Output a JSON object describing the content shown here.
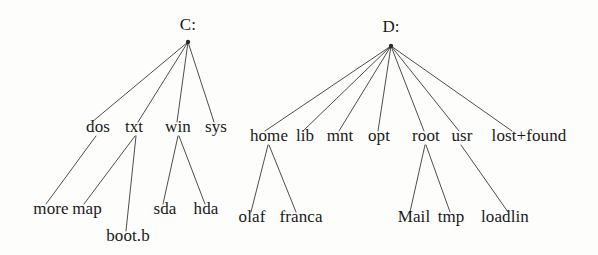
{
  "diagram": {
    "title": "",
    "type": "filesystem-tree",
    "ink_color": "#19191a",
    "line_color": "#3a3a38",
    "background_color": "#fdfdfb",
    "trees": [
      {
        "id": "c-drive",
        "root": {
          "label": "C:",
          "x": 188,
          "y": 30,
          "node_x": 188,
          "node_y": 42
        },
        "level2": [
          {
            "label": "dos",
            "x": 98,
            "y": 132,
            "anchor_x": 98,
            "anchor_y": 122
          },
          {
            "label": "txt",
            "x": 134,
            "y": 132,
            "anchor_x": 134,
            "anchor_y": 122
          },
          {
            "label": "win",
            "x": 178,
            "y": 132,
            "anchor_x": 178,
            "anchor_y": 122
          },
          {
            "label": "sys",
            "x": 216,
            "y": 132,
            "anchor_x": 216,
            "anchor_y": 122
          }
        ],
        "level3": [
          {
            "label": "more",
            "x": 51,
            "y": 214,
            "parent": "dos"
          },
          {
            "label": "map",
            "x": 87,
            "y": 214,
            "parent": "txt"
          },
          {
            "label": "boot.b",
            "x": 128,
            "y": 241,
            "parent": "txt"
          },
          {
            "label": "sda",
            "x": 165,
            "y": 214,
            "parent": "win"
          },
          {
            "label": "hda",
            "x": 206,
            "y": 214,
            "parent": "win"
          }
        ]
      },
      {
        "id": "d-drive",
        "root": {
          "label": "D:",
          "x": 391,
          "y": 32,
          "node_x": 391,
          "node_y": 46
        },
        "level2": [
          {
            "label": "home",
            "x": 269,
            "y": 141,
            "anchor_x": 269,
            "anchor_y": 131
          },
          {
            "label": "lib",
            "x": 305,
            "y": 141,
            "anchor_x": 305,
            "anchor_y": 131
          },
          {
            "label": "mnt",
            "x": 340,
            "y": 141,
            "anchor_x": 340,
            "anchor_y": 131
          },
          {
            "label": "opt",
            "x": 379,
            "y": 141,
            "anchor_x": 379,
            "anchor_y": 131
          },
          {
            "label": "root",
            "x": 426,
            "y": 141,
            "anchor_x": 426,
            "anchor_y": 131
          },
          {
            "label": "usr",
            "x": 462,
            "y": 141,
            "anchor_x": 462,
            "anchor_y": 131
          },
          {
            "label": "lost+found",
            "x": 529,
            "y": 141,
            "anchor_x": 512,
            "anchor_y": 131
          }
        ],
        "level3": [
          {
            "label": "olaf",
            "x": 252,
            "y": 222,
            "parent": "home"
          },
          {
            "label": "franca",
            "x": 301,
            "y": 222,
            "parent": "home"
          },
          {
            "label": "Mail",
            "x": 414,
            "y": 222,
            "parent": "root"
          },
          {
            "label": "tmp",
            "x": 451,
            "y": 222,
            "parent": "root"
          },
          {
            "label": "loadlin",
            "x": 505,
            "y": 222,
            "parent": "usr"
          }
        ]
      }
    ],
    "edges": [
      {
        "name": "c-root-to-dos",
        "x1": 188,
        "y1": 42,
        "x2": 92,
        "y2": 122
      },
      {
        "name": "c-root-to-txt",
        "x1": 188,
        "y1": 42,
        "x2": 138,
        "y2": 122
      },
      {
        "name": "c-root-to-win",
        "x1": 188,
        "y1": 42,
        "x2": 177,
        "y2": 122
      },
      {
        "name": "c-root-to-sys",
        "x1": 188,
        "y1": 42,
        "x2": 214,
        "y2": 122
      },
      {
        "name": "c-dos-to-more",
        "x1": 96,
        "y1": 136,
        "x2": 46,
        "y2": 204
      },
      {
        "name": "c-txt-to-map",
        "x1": 135,
        "y1": 136,
        "x2": 84,
        "y2": 204
      },
      {
        "name": "c-txt-to-bootb",
        "x1": 136,
        "y1": 136,
        "x2": 126,
        "y2": 231
      },
      {
        "name": "c-win-to-sda",
        "x1": 178,
        "y1": 136,
        "x2": 163,
        "y2": 204
      },
      {
        "name": "c-win-to-hda",
        "x1": 179,
        "y1": 136,
        "x2": 205,
        "y2": 204
      },
      {
        "name": "d-root-to-home",
        "x1": 391,
        "y1": 46,
        "x2": 265,
        "y2": 131
      },
      {
        "name": "d-root-to-lib",
        "x1": 391,
        "y1": 46,
        "x2": 303,
        "y2": 131
      },
      {
        "name": "d-root-to-mnt",
        "x1": 391,
        "y1": 46,
        "x2": 339,
        "y2": 131
      },
      {
        "name": "d-root-to-opt",
        "x1": 391,
        "y1": 46,
        "x2": 378,
        "y2": 131
      },
      {
        "name": "d-root-to-root",
        "x1": 391,
        "y1": 46,
        "x2": 424,
        "y2": 131
      },
      {
        "name": "d-root-to-usr",
        "x1": 391,
        "y1": 46,
        "x2": 459,
        "y2": 131
      },
      {
        "name": "d-root-to-lostfound",
        "x1": 391,
        "y1": 46,
        "x2": 512,
        "y2": 131
      },
      {
        "name": "d-home-to-olaf",
        "x1": 268,
        "y1": 145,
        "x2": 251,
        "y2": 212
      },
      {
        "name": "d-home-to-franca",
        "x1": 269,
        "y1": 145,
        "x2": 296,
        "y2": 212
      },
      {
        "name": "d-root-dir-to-mail",
        "x1": 425,
        "y1": 145,
        "x2": 410,
        "y2": 212
      },
      {
        "name": "d-root-dir-to-tmp",
        "x1": 426,
        "y1": 145,
        "x2": 450,
        "y2": 212
      },
      {
        "name": "d-usr-to-loadlin",
        "x1": 461,
        "y1": 145,
        "x2": 508,
        "y2": 212
      }
    ]
  }
}
